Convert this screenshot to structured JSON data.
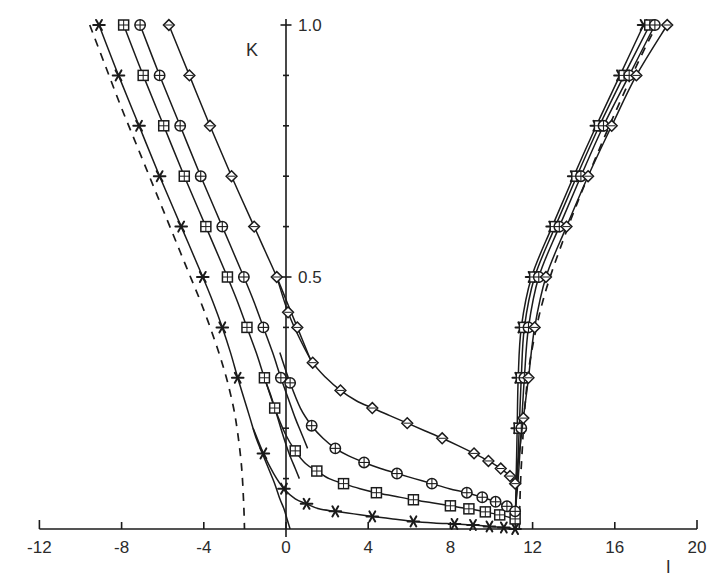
{
  "chart_data": {
    "type": "line",
    "title": "",
    "xlabel": "l",
    "ylabel": "K",
    "xlim": [
      -12,
      20
    ],
    "ylim": [
      0.0,
      1.0
    ],
    "grid": false,
    "legend_position": "none",
    "x_ticks": [
      -12,
      -8,
      -4,
      0,
      4,
      8,
      12,
      16,
      20
    ],
    "x_tick_labels": [
      "-12",
      "-8",
      "-4",
      "0",
      "4",
      "8",
      "12",
      "16",
      "20"
    ],
    "x_minor_step": 4,
    "y_ticks": [
      0.5,
      1.0
    ],
    "y_tick_labels": [
      "0.5",
      "1.0"
    ],
    "y_minor_step": 0.1,
    "annotations": [
      {
        "name": "left-asymptote",
        "type": "dashed-vertical-curve",
        "x_approx": -2.0
      },
      {
        "name": "right-asymptote",
        "type": "dashed-vertical-curve",
        "x_approx": 11.2
      }
    ],
    "series": [
      {
        "name": "star",
        "marker": "asterisk",
        "color": "#1b1b1b",
        "left_branch": {
          "k": [
            1.0,
            0.9,
            0.8,
            0.7,
            0.6,
            0.5,
            0.45,
            0.4,
            0.35,
            0.3,
            0.26,
            0.22,
            0.18,
            0.15,
            0.12,
            0.09,
            0.06,
            0.04,
            0.02,
            0.0
          ],
          "l": [
            -9.1,
            -8.15,
            -7.15,
            -6.15,
            -5.1,
            -4.05,
            -3.55,
            -3.1,
            -2.7,
            -2.35,
            -2.05,
            -1.75,
            -1.45,
            -1.15,
            -0.85,
            -0.55,
            -0.3,
            -0.1,
            0.05,
            0.2
          ]
        },
        "lower_branch": {
          "k": [
            0.2,
            0.15,
            0.11,
            0.08,
            0.06,
            0.05,
            0.04,
            0.035,
            0.03,
            0.025,
            0.02,
            0.015,
            0.012,
            0.01,
            0.008,
            0.005,
            0.003,
            0.0
          ],
          "l": [
            -1.6,
            -1.1,
            -0.6,
            -0.1,
            0.45,
            1.0,
            1.6,
            2.4,
            3.3,
            4.2,
            5.2,
            6.2,
            7.2,
            8.2,
            9.1,
            9.9,
            10.6,
            11.15
          ]
        },
        "right_branch": {
          "k": [
            0.0,
            0.1,
            0.2,
            0.3,
            0.4,
            0.5,
            0.6,
            0.7,
            0.8,
            0.9,
            1.0
          ],
          "l": [
            11.15,
            11.2,
            11.25,
            11.3,
            11.45,
            11.95,
            12.95,
            14.0,
            15.1,
            16.25,
            17.4
          ]
        }
      },
      {
        "name": "square",
        "marker": "square",
        "color": "#1b1b1b",
        "left_branch": {
          "k": [
            1.0,
            0.9,
            0.8,
            0.7,
            0.6,
            0.5,
            0.45,
            0.4,
            0.35,
            0.3,
            0.26,
            0.22,
            0.18,
            0.15,
            0.12,
            0.1
          ],
          "l": [
            -7.9,
            -6.95,
            -5.95,
            -4.95,
            -3.9,
            -2.85,
            -2.35,
            -1.9,
            -1.45,
            -1.05,
            -0.7,
            -0.4,
            -0.1,
            0.15,
            0.45,
            0.65
          ]
        },
        "lower_branch": {
          "k": [
            0.3,
            0.24,
            0.19,
            0.155,
            0.13,
            0.115,
            0.1,
            0.09,
            0.08,
            0.072,
            0.065,
            0.058,
            0.052,
            0.046,
            0.04,
            0.034,
            0.028,
            0.02
          ],
          "l": [
            -1.05,
            -0.55,
            -0.05,
            0.45,
            0.95,
            1.5,
            2.1,
            2.8,
            3.6,
            4.4,
            5.3,
            6.2,
            7.1,
            8.0,
            8.9,
            9.7,
            10.4,
            11.15
          ]
        },
        "right_branch": {
          "k": [
            0.02,
            0.1,
            0.2,
            0.3,
            0.4,
            0.5,
            0.6,
            0.7,
            0.8,
            0.9,
            1.0
          ],
          "l": [
            11.15,
            11.25,
            11.35,
            11.45,
            11.6,
            12.1,
            13.1,
            14.15,
            15.25,
            16.45,
            17.7
          ]
        }
      },
      {
        "name": "circle",
        "marker": "circle",
        "color": "#1b1b1b",
        "left_branch": {
          "k": [
            1.0,
            0.9,
            0.8,
            0.7,
            0.6,
            0.5,
            0.45,
            0.4,
            0.35,
            0.3,
            0.26,
            0.22,
            0.19,
            0.16
          ],
          "l": [
            -7.1,
            -6.15,
            -5.15,
            -4.15,
            -3.1,
            -2.05,
            -1.55,
            -1.1,
            -0.65,
            -0.25,
            0.1,
            0.45,
            0.75,
            1.05
          ]
        },
        "lower_branch": {
          "k": [
            0.35,
            0.29,
            0.24,
            0.205,
            0.18,
            0.16,
            0.145,
            0.132,
            0.12,
            0.11,
            0.1,
            0.09,
            0.08,
            0.072,
            0.063,
            0.054,
            0.045,
            0.035
          ],
          "l": [
            -0.3,
            0.2,
            0.7,
            1.25,
            1.8,
            2.4,
            3.05,
            3.8,
            4.6,
            5.4,
            6.25,
            7.1,
            7.95,
            8.8,
            9.55,
            10.2,
            10.75,
            11.15
          ]
        },
        "right_branch": {
          "k": [
            0.035,
            0.1,
            0.2,
            0.3,
            0.4,
            0.5,
            0.6,
            0.7,
            0.8,
            0.9,
            1.0
          ],
          "l": [
            11.15,
            11.3,
            11.45,
            11.6,
            11.8,
            12.3,
            13.3,
            14.35,
            15.45,
            16.7,
            17.95
          ]
        }
      },
      {
        "name": "diamond",
        "marker": "diamond",
        "color": "#1b1b1b",
        "left_branch": {
          "k": [
            1.0,
            0.9,
            0.8,
            0.7,
            0.6,
            0.55,
            0.5,
            0.45,
            0.4,
            0.36,
            0.32
          ],
          "l": [
            -5.7,
            -4.7,
            -3.7,
            -2.65,
            -1.55,
            -1.0,
            -0.45,
            0.05,
            0.55,
            0.95,
            1.35
          ]
        },
        "lower_branch": {
          "k": [
            0.5,
            0.43,
            0.375,
            0.33,
            0.3,
            0.275,
            0.255,
            0.24,
            0.225,
            0.21,
            0.195,
            0.18,
            0.165,
            0.15,
            0.135,
            0.12,
            0.105,
            0.09
          ],
          "l": [
            -0.45,
            0.1,
            0.7,
            1.3,
            1.95,
            2.65,
            3.4,
            4.2,
            5.05,
            5.9,
            6.75,
            7.6,
            8.4,
            9.15,
            9.85,
            10.45,
            10.9,
            11.15
          ]
        },
        "right_branch": {
          "k": [
            0.09,
            0.15,
            0.22,
            0.3,
            0.4,
            0.5,
            0.6,
            0.7,
            0.8,
            0.9,
            1.0
          ],
          "l": [
            11.15,
            11.35,
            11.55,
            11.8,
            12.1,
            12.65,
            13.65,
            14.7,
            15.85,
            17.05,
            18.55
          ]
        }
      }
    ],
    "dashed_left": {
      "k": [
        1.0,
        0.92,
        0.84,
        0.76,
        0.68,
        0.6,
        0.52,
        0.44,
        0.36,
        0.3,
        0.24,
        0.19,
        0.14,
        0.1,
        0.06,
        0.03,
        0.0
      ],
      "l": [
        -9.55,
        -8.8,
        -8.05,
        -7.25,
        -6.45,
        -5.65,
        -4.85,
        -4.05,
        -3.35,
        -2.9,
        -2.55,
        -2.35,
        -2.2,
        -2.12,
        -2.07,
        -2.04,
        -2.02
      ]
    },
    "dashed_right": {
      "k": [
        0.0,
        0.05,
        0.1,
        0.16,
        0.24,
        0.34,
        0.46,
        0.58,
        0.7,
        0.82,
        0.94,
        1.0
      ],
      "l": [
        11.35,
        11.38,
        11.42,
        11.5,
        11.62,
        11.9,
        12.55,
        13.55,
        14.7,
        15.95,
        17.3,
        18.05
      ]
    }
  },
  "axis_labels": {
    "x_name": "l",
    "y_name": "K"
  }
}
